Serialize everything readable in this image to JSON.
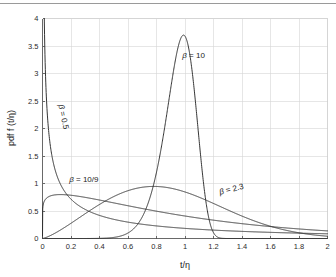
{
  "figure": {
    "top_rule_color": "#9a9a9a",
    "background": "#ffffff"
  },
  "chart_data": {
    "type": "line",
    "title": "",
    "xlabel": "t/η",
    "ylabel": "pdf f (t/η)",
    "xlim": [
      0,
      2
    ],
    "ylim": [
      0,
      4
    ],
    "grid": true,
    "legend_position": "inline-annotations",
    "xticks": [
      "0",
      "0.2",
      "0.4",
      "0.6",
      "0.8",
      "1",
      "1.2",
      "1.4",
      "1.6",
      "1.8",
      "2"
    ],
    "xtick_values": [
      0,
      0.2,
      0.4,
      0.6,
      0.8,
      1,
      1.2,
      1.4,
      1.6,
      1.8,
      2
    ],
    "yticks": [
      "0",
      "0.5",
      "1",
      "1.5",
      "2",
      "2.5",
      "3",
      "3.5",
      "4"
    ],
    "ytick_values": [
      0,
      0.5,
      1,
      1.5,
      2,
      2.5,
      3,
      3.5,
      4
    ],
    "distribution": "Weibull probability density function",
    "eta": 1,
    "series": [
      {
        "name": "β = 0.5",
        "beta": 0.5,
        "label": "β = 0.5",
        "label_x": 0.13,
        "label_y": 2.2,
        "label_rotation": 78,
        "peak_x": 0.0,
        "peak_y": 4.0,
        "description": "monotonically decreasing from axis, crosses 1.0 near t/η=0.2, tail ~0.07 at t/η=2"
      },
      {
        "name": "β = 10/9",
        "beta": 1.1111,
        "label": "β = 10/9",
        "label_x": 0.29,
        "label_y": 1.02,
        "label_rotation": 0,
        "peak_x": 0.15,
        "peak_y": 0.78,
        "description": "rises steeply to ~0.78 near t/η=0.15 then decays slowly to ~0.14 at t/η=2"
      },
      {
        "name": "β = 2.3",
        "beta": 2.3,
        "label": "β = 2.3",
        "label_x": 1.33,
        "label_y": 0.85,
        "label_rotation": -14,
        "peak_x": 0.78,
        "peak_y": 0.93,
        "description": "broad hump peaking ~0.93 near t/η=0.78, tail ~0.1 at t/η=2"
      },
      {
        "name": "β = 10",
        "beta": 10,
        "label": "β = 10",
        "label_x": 1.06,
        "label_y": 3.28,
        "label_rotation": 0,
        "peak_x": 0.965,
        "peak_y": 3.7,
        "description": "sharp narrow peak ~3.7 at t/η=0.97, essentially zero outside 0.6–1.25"
      }
    ]
  }
}
